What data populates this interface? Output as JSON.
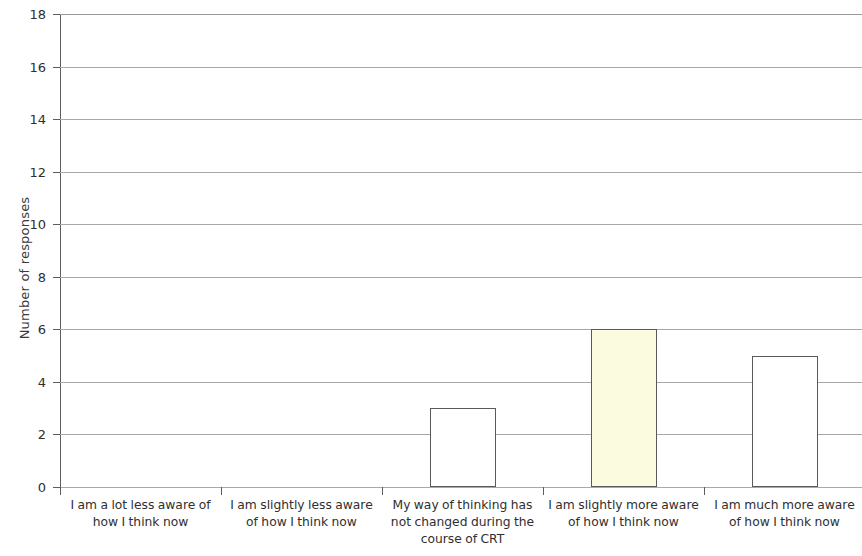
{
  "chart_data": {
    "type": "bar",
    "title": "",
    "xlabel": "",
    "ylabel": "Number of responses",
    "ylim": [
      0,
      18
    ],
    "ytick_step": 2,
    "grid": true,
    "legend": "none",
    "categories": [
      "I am a lot less aware of how I think now",
      "I am slightly less aware of how I think now",
      "My way of thinking has not changed during the course of CRT",
      "I am slightly more aware of how I think now",
      "I am much more aware of how I think now"
    ],
    "values": [
      0,
      0,
      3,
      6,
      5
    ],
    "bar_colors": [
      "#ffffff",
      "#ffffff",
      "#ffffff",
      "#fbfbdf",
      "#ffffff"
    ],
    "bar_outline_color": "#5a5a5a",
    "ytick_labels": [
      "0",
      "2",
      "4",
      "6",
      "8",
      "10",
      "12",
      "14",
      "16",
      "18"
    ],
    "gridline_color": "#a8a8a8",
    "axis_color": "#5d5d5d"
  },
  "axis": {
    "y_title": "Number of responses"
  },
  "x_labels": [
    {
      "line1": "I am a lot less aware of",
      "line2": "how I think now",
      "line3": ""
    },
    {
      "line1": "I am slightly less aware",
      "line2": "of how I think now",
      "line3": ""
    },
    {
      "line1": "My way of thinking has",
      "line2": "not changed during the",
      "line3": "course of CRT"
    },
    {
      "line1": "I am slightly more aware",
      "line2": "of how I think now",
      "line3": ""
    },
    {
      "line1": "I am much more aware",
      "line2": "of how I think now",
      "line3": ""
    }
  ],
  "y_ticks": [
    {
      "label": "18"
    },
    {
      "label": "16"
    },
    {
      "label": "14"
    },
    {
      "label": "12"
    },
    {
      "label": "10"
    },
    {
      "label": "8"
    },
    {
      "label": "6"
    },
    {
      "label": "4"
    },
    {
      "label": "2"
    },
    {
      "label": "0"
    }
  ]
}
